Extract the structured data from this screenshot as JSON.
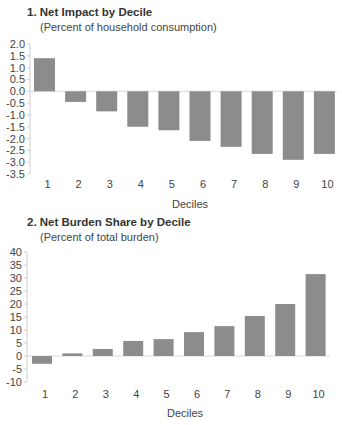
{
  "chart_data": [
    {
      "type": "bar",
      "title": "1. Net Impact by Decile",
      "subtitle": "(Percent of household consumption)",
      "xlabel": "Deciles",
      "ylabel": "",
      "categories": [
        "1",
        "2",
        "3",
        "4",
        "5",
        "6",
        "7",
        "8",
        "9",
        "10"
      ],
      "values": [
        1.4,
        -0.45,
        -0.85,
        -1.5,
        -1.65,
        -2.1,
        -2.35,
        -2.65,
        -2.9,
        -2.65
      ],
      "ylim": [
        -3.5,
        2.0
      ],
      "yticks": [
        "2.0",
        "1.5",
        "1.0",
        "0.5",
        "0.0",
        "-0.5",
        "-1.0",
        "-1.5",
        "-2.0",
        "-2.5",
        "-3.0",
        "-3.5"
      ],
      "ytick_values": [
        2.0,
        1.5,
        1.0,
        0.5,
        0.0,
        -0.5,
        -1.0,
        -1.5,
        -2.0,
        -2.5,
        -3.0,
        -3.5
      ],
      "grid": false,
      "legend": "none",
      "bar_color": "#8c8c8c"
    },
    {
      "type": "bar",
      "title": "2. Net Burden Share by Decile",
      "subtitle": "(Percent of total burden)",
      "xlabel": "Deciles",
      "ylabel": "",
      "categories": [
        "1",
        "2",
        "3",
        "4",
        "5",
        "6",
        "7",
        "8",
        "9",
        "10"
      ],
      "values": [
        -3.0,
        1.0,
        2.7,
        5.8,
        6.5,
        9.2,
        11.5,
        15.4,
        20.0,
        31.5
      ],
      "ylim": [
        -10,
        40
      ],
      "yticks": [
        "40",
        "35",
        "30",
        "25",
        "20",
        "15",
        "10",
        "5",
        "0",
        "-5",
        "-10"
      ],
      "ytick_values": [
        40,
        35,
        30,
        25,
        20,
        15,
        10,
        5,
        0,
        -5,
        -10
      ],
      "grid": false,
      "legend": "none",
      "bar_color": "#8c8c8c"
    }
  ]
}
